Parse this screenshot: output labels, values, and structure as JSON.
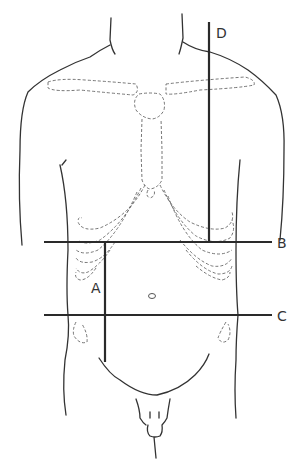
{
  "diagram": {
    "planes": [
      {
        "id": "A",
        "label": "A",
        "orientation": "vertical",
        "x": 105,
        "y1": 242,
        "y2": 362
      },
      {
        "id": "B",
        "label": "B",
        "orientation": "horizontal",
        "y": 242,
        "x1": 44,
        "x2": 272
      },
      {
        "id": "C",
        "label": "C",
        "orientation": "horizontal",
        "y": 315,
        "x1": 44,
        "x2": 272
      },
      {
        "id": "D",
        "label": "D",
        "orientation": "vertical",
        "x": 209,
        "y1": 22,
        "y2": 242
      }
    ],
    "structures": [
      "clavicles",
      "sternum",
      "costal margins",
      "umbilicus",
      "anterior superior iliac spines",
      "torso outline"
    ],
    "colors": {
      "line": "#2a2a2a",
      "dashed": "#666666",
      "background": "#ffffff"
    }
  }
}
